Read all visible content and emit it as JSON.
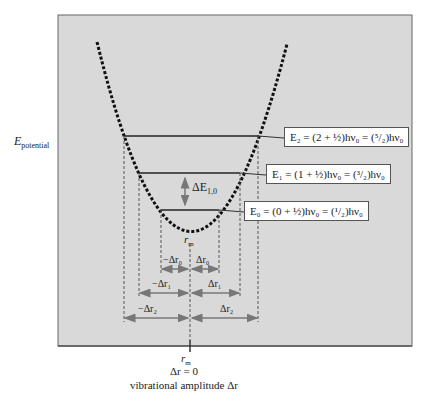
{
  "diagram": {
    "y_axis_label": "E",
    "y_axis_label_sub": "potential",
    "x_axis": {
      "rm_label": "r",
      "rm_sub": "m",
      "zero_label": "Δr = 0",
      "caption": "vibrational amplitude Δr"
    },
    "vertex_label": "r",
    "vertex_label_sub": "m",
    "delta_e_label": "ΔE",
    "delta_e_sub": "1,0",
    "levels": [
      {
        "name": "E2",
        "text": "E₂ = (2 + ½)hν₀ = (⁵/₂)hν₀"
      },
      {
        "name": "E1",
        "text": "E₁ = (1 + ½)hν₀ = (³/₂)hν₀"
      },
      {
        "name": "E0",
        "text": "E₀ = (0 + ½)hν₀ = (¹/₂)hν₀"
      }
    ],
    "amplitudes": [
      {
        "neg": "−Δr₀",
        "pos": "Δr₀"
      },
      {
        "neg": "−Δr₁",
        "pos": "Δr₁"
      },
      {
        "neg": "−Δr₂",
        "pos": "Δr₂"
      }
    ],
    "colors": {
      "panel": "#d9d9d9",
      "panel_border": "#666666",
      "curve": "#111111",
      "level_line": "#222222",
      "arrow": "#777777"
    }
  }
}
